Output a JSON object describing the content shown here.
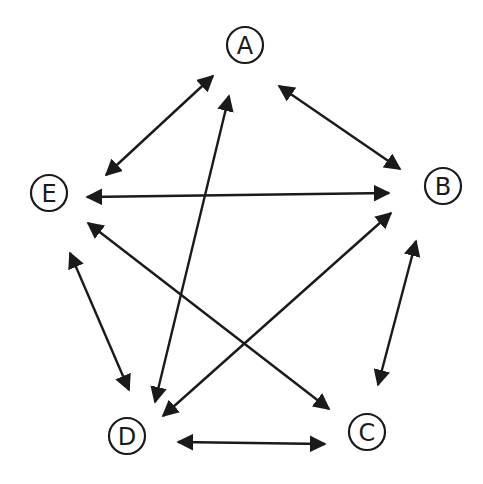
{
  "diagram": {
    "type": "graph",
    "directed": "bidirectional",
    "colors": {
      "stroke": "#1a1a1a",
      "background": "#ffffff"
    },
    "nodes": [
      {
        "id": "A",
        "label": "A",
        "x": 245,
        "y": 45
      },
      {
        "id": "B",
        "label": "B",
        "x": 443,
        "y": 186
      },
      {
        "id": "C",
        "label": "C",
        "x": 367,
        "y": 432
      },
      {
        "id": "D",
        "label": "D",
        "x": 127,
        "y": 436
      },
      {
        "id": "E",
        "label": "E",
        "x": 49,
        "y": 193
      }
    ],
    "edges": [
      {
        "from": "A",
        "to": "E",
        "x1": 213,
        "y1": 76,
        "x2": 106,
        "y2": 175
      },
      {
        "from": "A",
        "to": "B",
        "x1": 279,
        "y1": 86,
        "x2": 400,
        "y2": 169
      },
      {
        "from": "A",
        "to": "D",
        "x1": 229,
        "y1": 96,
        "x2": 155,
        "y2": 402
      },
      {
        "from": "E",
        "to": "B",
        "x1": 87,
        "y1": 197,
        "x2": 389,
        "y2": 193
      },
      {
        "from": "E",
        "to": "C",
        "x1": 88,
        "y1": 223,
        "x2": 329,
        "y2": 409
      },
      {
        "from": "B",
        "to": "D",
        "x1": 391,
        "y1": 213,
        "x2": 163,
        "y2": 416
      },
      {
        "from": "B",
        "to": "C",
        "x1": 416,
        "y1": 241,
        "x2": 378,
        "y2": 385
      },
      {
        "from": "E",
        "to": "D",
        "x1": 70,
        "y1": 253,
        "x2": 129,
        "y2": 390
      },
      {
        "from": "D",
        "to": "C",
        "x1": 178,
        "y1": 442,
        "x2": 325,
        "y2": 444
      }
    ]
  }
}
